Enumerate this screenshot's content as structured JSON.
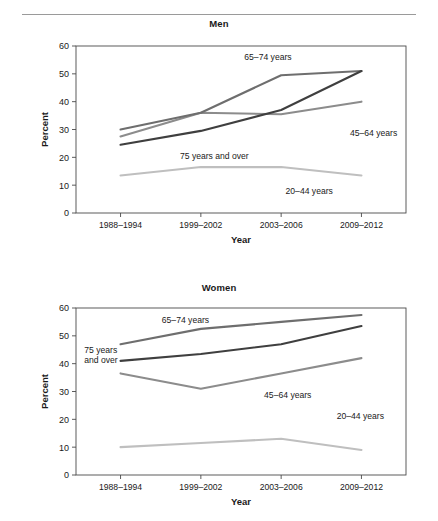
{
  "figure": {
    "axis_x_title": "Year",
    "axis_y_title": "Percent",
    "footnote": ""
  },
  "panels": [
    {
      "key": "men",
      "title": "Men"
    },
    {
      "key": "women",
      "title": "Women"
    }
  ],
  "series_colors": {
    "age_20_44": "#bfbfbf",
    "age_45_64": "#8c8c8c",
    "age_65_74": "#6e6e6e",
    "age_75_over": "#3f3f3f"
  },
  "chart_data": [
    {
      "type": "line",
      "title": "Men",
      "xlabel": "Year",
      "ylabel": "Percent",
      "ylim": [
        0,
        60
      ],
      "yticks": [
        0,
        10,
        20,
        30,
        40,
        50,
        60
      ],
      "grid": false,
      "legend": "inline-annotations",
      "categories": [
        "1988–1994",
        "1999–2002",
        "2003–2006",
        "2009–2012"
      ],
      "series": [
        {
          "name": "20–44 years",
          "values": [
            13.5,
            16.5,
            16.5,
            13.5
          ],
          "color": "#bfbfbf",
          "label_x_pct": 63.5,
          "label_y_val": 7.0
        },
        {
          "name": "45–64 years",
          "values": [
            27.5,
            36.0,
            35.5,
            40.0
          ],
          "color": "#8c8c8c",
          "label_x_pct": 83.0,
          "label_y_val": 27.5
        },
        {
          "name": "65–74 years",
          "values": [
            30.0,
            36.0,
            49.5,
            51.0
          ],
          "color": "#6e6e6e",
          "label_x_pct": 51.0,
          "label_y_val": 55.0
        },
        {
          "name": "75 years and over",
          "values": [
            24.5,
            29.5,
            37.0,
            51.0
          ],
          "color": "#3f3f3f",
          "label_x_pct": 31.5,
          "label_y_val": 19.5
        }
      ]
    },
    {
      "type": "line",
      "title": "Women",
      "xlabel": "Year",
      "ylabel": "Percent",
      "ylim": [
        0,
        60
      ],
      "yticks": [
        0,
        10,
        20,
        30,
        40,
        50,
        60
      ],
      "grid": false,
      "legend": "inline-annotations",
      "categories": [
        "1988–1994",
        "1999–2002",
        "2003–2006",
        "2009–2012"
      ],
      "series": [
        {
          "name": "20–44 years",
          "values": [
            10.0,
            11.5,
            13.0,
            9.0
          ],
          "color": "#bfbfbf",
          "label_x_pct": 79.0,
          "label_y_val": 20.0
        },
        {
          "name": "45–64 years",
          "values": [
            36.5,
            31.0,
            36.5,
            42.0
          ],
          "color": "#8c8c8c",
          "label_x_pct": 57.0,
          "label_y_val": 27.5
        },
        {
          "name": "65–74 years",
          "values": [
            47.0,
            52.5,
            55.0,
            57.5
          ],
          "color": "#6e6e6e",
          "label_x_pct": 26.0,
          "label_y_val": 54.5
        },
        {
          "name": "75 years and over",
          "values": [
            41.0,
            43.5,
            47.0,
            53.5
          ],
          "color": "#3f3f3f",
          "label_x_pct": 2.5,
          "label_y_val": 44.0
        }
      ]
    }
  ]
}
